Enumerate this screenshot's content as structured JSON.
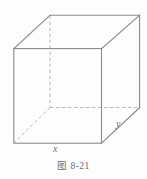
{
  "figure": {
    "caption": "图 8-21",
    "background_color": "#fdfdfd",
    "visible_edge_color": "#8a8a8a",
    "hidden_edge_color": "#b9b9b9",
    "label_color": "#6f6f6f",
    "shape": "rectangular-box",
    "labels": {
      "width_label": "x",
      "depth_label": "y"
    },
    "geometry": {
      "front_face": {
        "top_left": [
          13.5,
          48.5
        ],
        "top_right": [
          101.5,
          48.5
        ],
        "bottom_right": [
          101.5,
          143.5
        ],
        "bottom_left": [
          13.5,
          143.5
        ]
      },
      "back_face": {
        "top_left": [
          50,
          15
        ],
        "top_right": [
          140,
          15
        ],
        "bottom_right": [
          140,
          108
        ],
        "bottom_left": [
          50,
          108
        ]
      },
      "hidden_edges": [
        "back-vertical-left",
        "back-bottom-horizontal",
        "back-bottom-left-diagonal"
      ]
    }
  }
}
